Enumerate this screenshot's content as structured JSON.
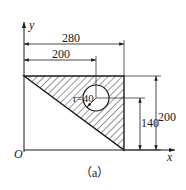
{
  "figure": {
    "caption": "（a）",
    "axes": {
      "x_label": "x",
      "y_label": "y",
      "origin_label": "O"
    },
    "dimensions": {
      "top_overall": "280",
      "top_hole_x": "200",
      "right_overall": "200",
      "right_hole_y": "140",
      "hole_radius": "r=40"
    },
    "shape": {
      "type": "right-triangle with circular hole",
      "hatched": true,
      "vertices_units": [
        [
          0,
          200
        ],
        [
          280,
          200
        ],
        [
          280,
          0
        ]
      ],
      "hole_center_units": [
        200,
        140
      ],
      "hole_radius_units": 40
    },
    "colors": {
      "line": "#1a1a1a",
      "background": "#ffffff"
    }
  }
}
